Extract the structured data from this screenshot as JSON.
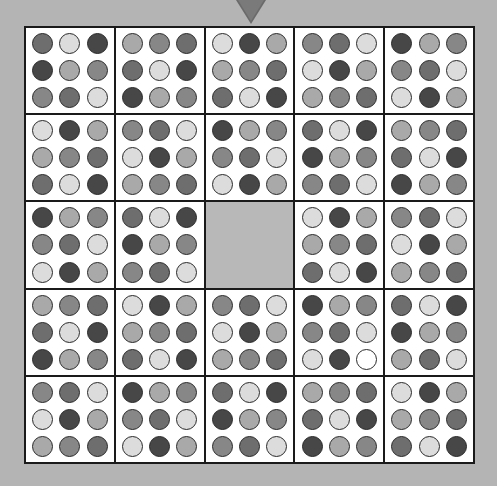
{
  "puzzle": {
    "grid_size": 5,
    "block_size": 3,
    "pointer": {
      "icon": "down-triangle-icon",
      "color": "#6a6a6a"
    },
    "colors": {
      "D": "#474747",
      "M2": "#6e6e6e",
      "M": "#878787",
      "L": "#a9a9a9",
      "W": "#dcdcdc",
      "X": "#ffffff"
    },
    "empty_block": {
      "row": 2,
      "col": 2,
      "color": "#b8b8b8"
    },
    "blocks": [
      [
        [
          [
            "M2",
            "W",
            "D"
          ],
          [
            "D",
            "L",
            "M"
          ],
          [
            "M",
            "M2",
            "W"
          ]
        ],
        [
          [
            "L",
            "M",
            "M2"
          ],
          [
            "M2",
            "W",
            "D"
          ],
          [
            "D",
            "L",
            "M"
          ]
        ],
        [
          [
            "W",
            "D",
            "L"
          ],
          [
            "L",
            "M",
            "M2"
          ],
          [
            "M2",
            "W",
            "D"
          ]
        ],
        [
          [
            "M",
            "M2",
            "W"
          ],
          [
            "W",
            "D",
            "L"
          ],
          [
            "L",
            "M",
            "M2"
          ]
        ],
        [
          [
            "D",
            "L",
            "M"
          ],
          [
            "M",
            "M2",
            "W"
          ],
          [
            "W",
            "D",
            "L"
          ]
        ]
      ],
      [
        [
          [
            "W",
            "D",
            "L"
          ],
          [
            "L",
            "M",
            "M2"
          ],
          [
            "M2",
            "W",
            "D"
          ]
        ],
        [
          [
            "M",
            "M2",
            "W"
          ],
          [
            "W",
            "D",
            "L"
          ],
          [
            "L",
            "M",
            "M2"
          ]
        ],
        [
          [
            "D",
            "L",
            "M"
          ],
          [
            "M",
            "M2",
            "W"
          ],
          [
            "W",
            "D",
            "L"
          ]
        ],
        [
          [
            "M2",
            "W",
            "D"
          ],
          [
            "D",
            "L",
            "M"
          ],
          [
            "M",
            "M2",
            "W"
          ]
        ],
        [
          [
            "L",
            "M",
            "M2"
          ],
          [
            "M2",
            "W",
            "D"
          ],
          [
            "D",
            "L",
            "M"
          ]
        ]
      ],
      [
        [
          [
            "D",
            "L",
            "M"
          ],
          [
            "M",
            "M2",
            "W"
          ],
          [
            "W",
            "D",
            "L"
          ]
        ],
        [
          [
            "M2",
            "W",
            "D"
          ],
          [
            "D",
            "L",
            "M"
          ],
          [
            "M",
            "M2",
            "W"
          ]
        ],
        null,
        [
          [
            "W",
            "D",
            "L"
          ],
          [
            "L",
            "M",
            "M2"
          ],
          [
            "M2",
            "W",
            "D"
          ]
        ],
        [
          [
            "M",
            "M2",
            "W"
          ],
          [
            "W",
            "D",
            "L"
          ],
          [
            "L",
            "M",
            "M2"
          ]
        ]
      ],
      [
        [
          [
            "L",
            "M",
            "M2"
          ],
          [
            "M2",
            "W",
            "D"
          ],
          [
            "D",
            "L",
            "M"
          ]
        ],
        [
          [
            "W",
            "D",
            "L"
          ],
          [
            "L",
            "M",
            "M2"
          ],
          [
            "M2",
            "W",
            "D"
          ]
        ],
        [
          [
            "M",
            "M2",
            "W"
          ],
          [
            "W",
            "D",
            "L"
          ],
          [
            "L",
            "M",
            "M2"
          ]
        ],
        [
          [
            "D",
            "L",
            "M"
          ],
          [
            "M",
            "M2",
            "W"
          ],
          [
            "W",
            "D",
            "X"
          ]
        ],
        [
          [
            "M2",
            "W",
            "D"
          ],
          [
            "D",
            "L",
            "M"
          ],
          [
            "L",
            "M2",
            "W"
          ]
        ]
      ],
      [
        [
          [
            "M",
            "M2",
            "W"
          ],
          [
            "W",
            "D",
            "L"
          ],
          [
            "L",
            "M",
            "M2"
          ]
        ],
        [
          [
            "D",
            "L",
            "M"
          ],
          [
            "M",
            "M2",
            "W"
          ],
          [
            "W",
            "D",
            "L"
          ]
        ],
        [
          [
            "M2",
            "W",
            "D"
          ],
          [
            "D",
            "L",
            "M"
          ],
          [
            "M",
            "M2",
            "W"
          ]
        ],
        [
          [
            "L",
            "M",
            "M2"
          ],
          [
            "M2",
            "W",
            "D"
          ],
          [
            "D",
            "L",
            "M"
          ]
        ],
        [
          [
            "W",
            "D",
            "L"
          ],
          [
            "L",
            "M",
            "M2"
          ],
          [
            "M2",
            "W",
            "D"
          ]
        ]
      ]
    ]
  }
}
